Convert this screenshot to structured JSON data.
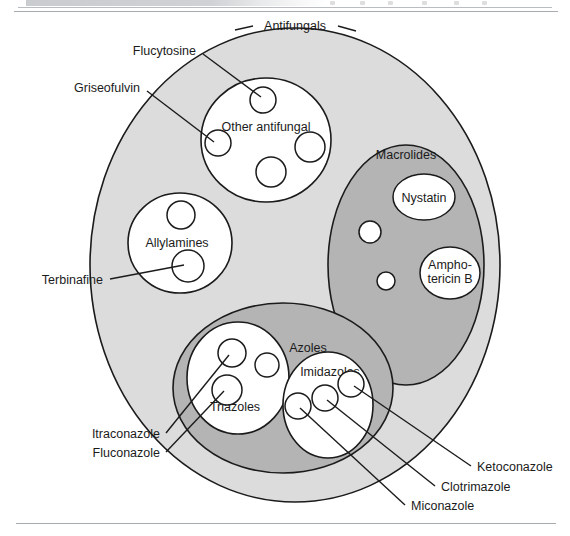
{
  "page": {
    "has_top_rule": true,
    "has_bottom_rule": true,
    "background_color": "#ffffff"
  },
  "colors": {
    "outer_fill": "#dcdcdc",
    "group_fill": "#b4b4b4",
    "leaf_fill": "#ffffff",
    "stroke": "#1b1b1b",
    "text": "#1b1b1b"
  },
  "diagram": {
    "type": "euler-venn-nested-sets",
    "outer": {
      "label": "Antifungals",
      "cx": 295,
      "cy": 265,
      "rx": 205,
      "ry": 237,
      "fill": "#dcdcdc"
    },
    "groups": [
      {
        "id": "other-antifungal",
        "label": "Other antifungal",
        "level": "leaf-set",
        "cx": 266,
        "cy": 140,
        "rx": 65,
        "ry": 62,
        "fill": "#ffffff",
        "label_x": 266,
        "label_y": 127,
        "members": [
          {
            "label": "Flucytosine",
            "cx": 263,
            "cy": 100,
            "r": 13
          },
          {
            "label": "Griseofulvin",
            "cx": 218,
            "cy": 143,
            "r": 13
          },
          {
            "label": "",
            "cx": 271,
            "cy": 172,
            "r": 15
          },
          {
            "label": "",
            "cx": 310,
            "cy": 147,
            "r": 15
          }
        ]
      },
      {
        "id": "allylamines",
        "label": "Allylamines",
        "level": "leaf-set",
        "cx": 180,
        "cy": 243,
        "rx": 52,
        "ry": 50,
        "fill": "#ffffff",
        "label_x": 177,
        "label_y": 243,
        "members": [
          {
            "label": "",
            "cx": 181,
            "cy": 215,
            "r": 14
          },
          {
            "label": "Terbinafine",
            "cx": 188,
            "cy": 266,
            "r": 16
          }
        ]
      },
      {
        "id": "macrolides",
        "label": "Macrolides",
        "level": "group-set",
        "cx": 406,
        "cy": 265,
        "rx": 78,
        "ry": 120,
        "fill": "#b4b4b4",
        "label_x": 406,
        "label_y": 155,
        "members": [
          {
            "label": "Nystatin",
            "cx": 424,
            "cy": 197,
            "rx": 31,
            "ry": 23
          },
          {
            "label": "Ampho- tericin B",
            "cx": 450,
            "cy": 273,
            "rx": 30,
            "ry": 26
          },
          {
            "label": "",
            "cx": 370,
            "cy": 232,
            "r": 11
          },
          {
            "label": "",
            "cx": 386,
            "cy": 281,
            "r": 9
          }
        ]
      },
      {
        "id": "azoles",
        "label": "Azoles",
        "level": "group-set",
        "cx": 283,
        "cy": 388,
        "rx": 110,
        "ry": 85,
        "fill": "#b4b4b4",
        "label_x": 308,
        "label_y": 348,
        "subgroups": [
          {
            "id": "triazoles",
            "label": "Triazoles",
            "cx": 238,
            "cy": 378,
            "rx": 51,
            "ry": 56,
            "fill": "#ffffff",
            "label_x": 235,
            "label_y": 407,
            "members": [
              {
                "label": "Itraconazole",
                "cx": 232,
                "cy": 353,
                "r": 14
              },
              {
                "label": "",
                "cx": 267,
                "cy": 365,
                "r": 12
              },
              {
                "label": "Fluconazole",
                "cx": 227,
                "cy": 390,
                "r": 15
              }
            ]
          },
          {
            "id": "imidazoles",
            "label": "Imidazoles",
            "cx": 328,
            "cy": 405,
            "rx": 45,
            "ry": 53,
            "fill": "#ffffff",
            "label_x": 330,
            "label_y": 372,
            "members": [
              {
                "label": "Ketoconazole",
                "cx": 351,
                "cy": 384,
                "r": 13
              },
              {
                "label": "Clotrimazole",
                "cx": 325,
                "cy": 398,
                "r": 13
              },
              {
                "label": "Miconazole",
                "cx": 298,
                "cy": 406,
                "r": 13
              }
            ]
          }
        ]
      }
    ],
    "callouts": [
      {
        "id": "flucytosine",
        "text": "Flucytosine",
        "anchor": "end",
        "tx": 196,
        "ty": 51,
        "lx1": 203,
        "ly1": 54,
        "lx2": 261,
        "ly2": 97
      },
      {
        "id": "griseofulvin",
        "text": "Griseofulvin",
        "anchor": "end",
        "tx": 140,
        "ty": 88,
        "lx1": 147,
        "ly1": 91,
        "lx2": 214,
        "ly2": 142
      },
      {
        "id": "terbinafine",
        "text": "Terbinafine",
        "anchor": "end",
        "tx": 103,
        "ty": 281,
        "lx1": 110,
        "ly1": 279,
        "lx2": 184,
        "ly2": 265
      },
      {
        "id": "itraconazole",
        "text": "Itraconazole",
        "anchor": "end",
        "tx": 160,
        "ty": 437,
        "lx1": 166,
        "ly1": 433,
        "lx2": 229,
        "ly2": 355
      },
      {
        "id": "fluconazole",
        "text": "Fluconazole",
        "anchor": "end",
        "tx": 160,
        "ty": 456,
        "lx1": 166,
        "ly1": 452,
        "lx2": 224,
        "ly2": 391
      },
      {
        "id": "ketoconazole",
        "text": "Ketoconazole",
        "anchor": "start",
        "tx": 477,
        "ty": 470,
        "lx1": 471,
        "ly1": 466,
        "lx2": 354,
        "ly2": 386
      },
      {
        "id": "clotrimazole",
        "text": "Clotrimazole",
        "anchor": "start",
        "tx": 441,
        "ty": 490,
        "lx1": 435,
        "ly1": 486,
        "lx2": 327,
        "ly2": 400
      },
      {
        "id": "miconazole",
        "text": "Miconazole",
        "anchor": "start",
        "tx": 411,
        "ty": 509,
        "lx1": 405,
        "ly1": 505,
        "lx2": 300,
        "ly2": 408
      }
    ],
    "outer_label_ticks": [
      {
        "x1": 235,
        "y1": 30,
        "x2": 253,
        "y2": 26
      },
      {
        "x1": 338,
        "y1": 26,
        "x2": 356,
        "y2": 31
      }
    ]
  }
}
